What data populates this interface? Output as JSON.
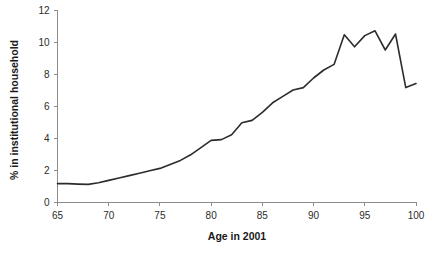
{
  "chart_data": {
    "type": "line",
    "title": "",
    "xlabel": "Age in 2001",
    "ylabel": "% in institutional household",
    "xlim": [
      65,
      100
    ],
    "ylim": [
      0,
      12
    ],
    "xticks": [
      65,
      70,
      75,
      80,
      85,
      90,
      95,
      100
    ],
    "xtick_labels": [
      "65",
      "70",
      "75",
      "80",
      "85",
      "90",
      "95",
      "100"
    ],
    "yticks": [
      0,
      2,
      4,
      6,
      8,
      10,
      12
    ],
    "ytick_labels": [
      "0",
      "2",
      "4",
      "6",
      "8",
      "10",
      "12"
    ],
    "grid": false,
    "legend": false,
    "line_color": "#2c2c2c",
    "series": [
      {
        "name": "% in institutional household",
        "x": [
          65,
          66,
          67,
          68,
          69,
          70,
          71,
          72,
          73,
          74,
          75,
          76,
          77,
          78,
          79,
          80,
          81,
          82,
          83,
          84,
          85,
          86,
          87,
          88,
          89,
          90,
          91,
          92,
          93,
          94,
          95,
          96,
          97,
          98,
          99,
          100
        ],
        "values": [
          1.15,
          1.15,
          1.12,
          1.1,
          1.2,
          1.35,
          1.5,
          1.65,
          1.8,
          1.95,
          2.1,
          2.35,
          2.6,
          2.95,
          3.4,
          3.85,
          3.9,
          4.2,
          4.95,
          5.1,
          5.6,
          6.2,
          6.6,
          7.0,
          7.15,
          7.75,
          8.25,
          8.6,
          10.45,
          9.7,
          10.4,
          10.7,
          9.5,
          10.5,
          7.15,
          7.4
        ]
      }
    ]
  }
}
